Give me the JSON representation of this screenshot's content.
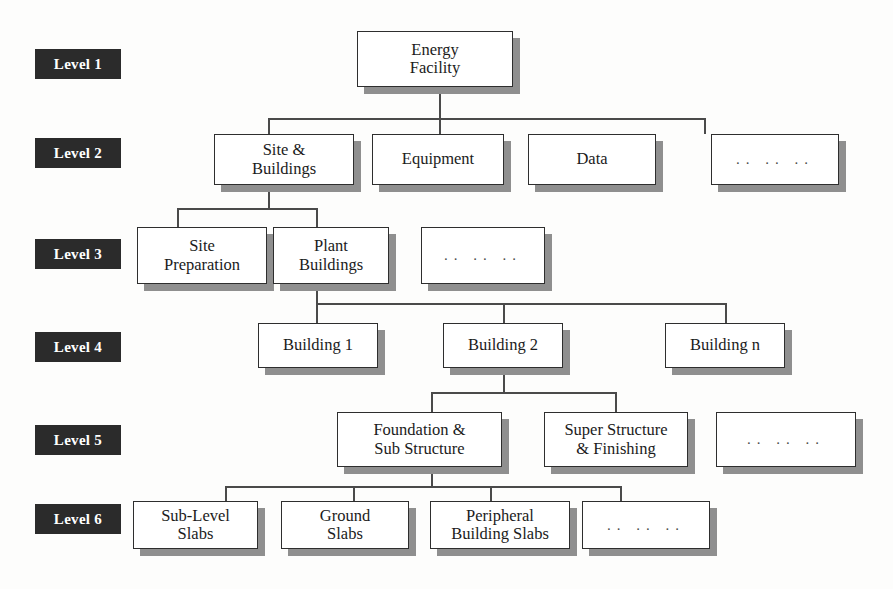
{
  "diagram": {
    "type": "hierarchy-tree",
    "box_fill": "#ffffff",
    "box_border": "#2e2e2e",
    "shadow_color": "#8f8f8f",
    "badge_bg": "#2b2b2b",
    "badge_fg": "#ffffff",
    "connector_color": "#4a4a4a",
    "ellipsis_text": ".. .. ..",
    "levels": [
      {
        "badge": "Level 1"
      },
      {
        "badge": "Level 2"
      },
      {
        "badge": "Level 3"
      },
      {
        "badge": "Level 4"
      },
      {
        "badge": "Level 5"
      },
      {
        "badge": "Level 6"
      }
    ],
    "nodes": {
      "energy_facility": "Energy\nFacility",
      "site_buildings": "Site &\nBuildings",
      "equipment": "Equipment",
      "data": "Data",
      "level2_more": ".. .. ..",
      "site_preparation": "Site\nPreparation",
      "plant_buildings": "Plant\nBuildings",
      "level3_more": ".. .. ..",
      "building_1": "Building 1",
      "building_2": "Building 2",
      "building_n": "Building n",
      "foundation_sub": "Foundation &\nSub Structure",
      "super_structure": "Super Structure\n& Finishing",
      "level5_more": ".. .. ..",
      "sub_level_slabs": "Sub-Level\nSlabs",
      "ground_slabs": "Ground\nSlabs",
      "peripheral_slabs": "Peripheral\nBuilding Slabs",
      "level6_more": ".. .. .."
    }
  }
}
